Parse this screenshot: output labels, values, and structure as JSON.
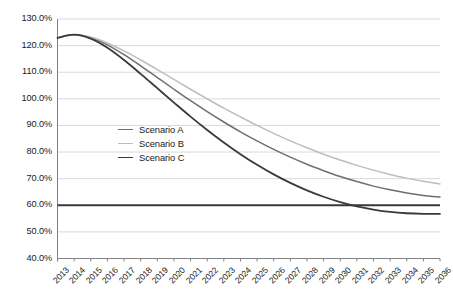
{
  "chart_data": {
    "type": "line",
    "title": "",
    "subtitle": "",
    "xlabel": "",
    "ylabel": "",
    "grid": true,
    "legend_position": "inside-center-left",
    "x": [
      "2013",
      "2014",
      "2015",
      "2016",
      "2017",
      "2018",
      "2019",
      "2020",
      "2021",
      "2022",
      "2023",
      "2024",
      "2025",
      "2026",
      "2027",
      "2028",
      "2029",
      "2030",
      "2031",
      "2032",
      "2033",
      "2034",
      "2035",
      "2036"
    ],
    "xlim": [
      2013,
      2036
    ],
    "ylim": [
      40,
      130
    ],
    "ytick_step": 10,
    "ytick_labels": [
      "130.0%",
      "120.0%",
      "110.0%",
      "100.0%",
      "90.0%",
      "80.0%",
      "70.0%",
      "60.0%",
      "50.0%",
      "40.0%"
    ],
    "ytick_values": [
      130,
      120,
      110,
      100,
      90,
      80,
      70,
      60,
      50,
      40
    ],
    "value_suffix": "%",
    "series": [
      {
        "name": "Scenario A",
        "color": "#6e6e6e",
        "width": 1.5,
        "values": [
          122.9,
          124.1,
          123.0,
          120.3,
          116.6,
          112.4,
          108.0,
          103.6,
          99.3,
          95.2,
          91.3,
          87.6,
          84.2,
          81.0,
          78.1,
          75.4,
          73.0,
          70.8,
          68.9,
          67.2,
          65.8,
          64.6,
          63.7,
          63.1
        ]
      },
      {
        "name": "Scenario B",
        "color": "#bdbdbd",
        "width": 1.5,
        "values": [
          122.9,
          124.1,
          123.2,
          121.0,
          118.0,
          114.6,
          111.0,
          107.3,
          103.6,
          100.0,
          96.5,
          93.2,
          90.0,
          87.0,
          84.2,
          81.6,
          79.2,
          77.0,
          75.0,
          73.2,
          71.6,
          70.2,
          69.0,
          68.0
        ]
      },
      {
        "name": "Scenario C",
        "color": "#3a3a3a",
        "width": 1.8,
        "values": [
          122.9,
          124.1,
          122.6,
          119.2,
          114.6,
          109.4,
          104.0,
          98.6,
          93.3,
          88.3,
          83.6,
          79.2,
          75.2,
          71.6,
          68.4,
          65.6,
          63.2,
          61.2,
          59.6,
          58.4,
          57.5,
          57.0,
          56.8,
          56.8
        ]
      }
    ],
    "reference_line": {
      "name": "floor-60",
      "value": 60,
      "color": "#3a3a3a",
      "width": 2.0
    },
    "colors": {
      "gridline": "#d9d9d9",
      "axis": "#808080",
      "text": "#1a1a1a",
      "background": "#ffffff"
    }
  },
  "legend": {
    "items": [
      {
        "label": "Scenario A",
        "color": "#6e6e6e",
        "width": 1.5
      },
      {
        "label": "Scenario B",
        "color": "#bdbdbd",
        "width": 1.5
      },
      {
        "label": "Scenario C",
        "color": "#3a3a3a",
        "width": 1.8
      }
    ]
  }
}
